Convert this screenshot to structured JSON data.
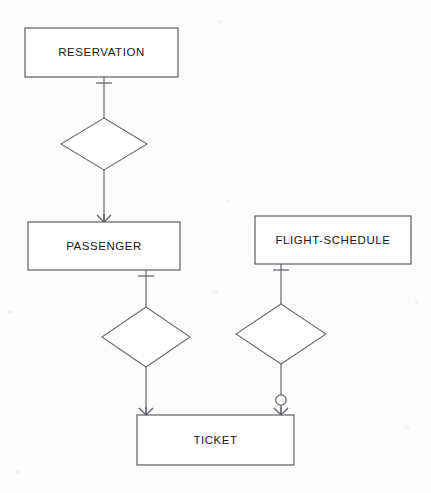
{
  "diagram": {
    "notation": "crow's-foot",
    "canvas": {
      "width": 431,
      "height": 493,
      "background": "#fdfdfd"
    },
    "colors": {
      "stroke": "#58585c",
      "line": "#6e6e74",
      "text": "#18181a",
      "fill": "#ffffff"
    },
    "entities": [
      {
        "id": "reservation",
        "label": "RESERVATION",
        "x": 25,
        "y": 28,
        "width": 153,
        "height": 49
      },
      {
        "id": "passenger",
        "label": "PASSENGER",
        "x": 28,
        "y": 222,
        "width": 152,
        "height": 48
      },
      {
        "id": "flight-schedule",
        "label": "FLIGHT-SCHEDULE",
        "x": 255,
        "y": 216,
        "width": 156,
        "height": 48
      },
      {
        "id": "ticket",
        "label": "TICKET",
        "x": 137,
        "y": 415,
        "width": 157,
        "height": 50
      }
    ],
    "relationships": [
      {
        "id": "reservation-passenger",
        "label": "",
        "cx": 104,
        "cy": 144,
        "rx": 43,
        "ry": 26,
        "from": "reservation",
        "to": "passenger",
        "from_cardinality": "one",
        "to_cardinality": "many"
      },
      {
        "id": "passenger-ticket",
        "label": "",
        "cx": 146,
        "cy": 337,
        "rx": 44,
        "ry": 30,
        "from": "passenger",
        "to": "ticket",
        "from_cardinality": "one",
        "to_cardinality": "many"
      },
      {
        "id": "flight-schedule-ticket",
        "label": "",
        "cx": 281,
        "cy": 334,
        "rx": 45,
        "ry": 30,
        "from": "flight-schedule",
        "to": "ticket",
        "from_cardinality": "one",
        "to_cardinality": "zero-or-many"
      }
    ],
    "connectors": [
      {
        "id": "conn-reservation-diamond",
        "x1": 104,
        "y1": 77,
        "x2": 104,
        "y2": 118
      },
      {
        "id": "conn-diamond-passenger",
        "x1": 104,
        "y1": 170,
        "x2": 104,
        "y2": 222
      },
      {
        "id": "conn-passenger-diamond2",
        "x1": 146,
        "y1": 270,
        "x2": 146,
        "y2": 307
      },
      {
        "id": "conn-diamond2-ticket",
        "x1": 146,
        "y1": 367,
        "x2": 146,
        "y2": 415
      },
      {
        "id": "conn-flight-diamond3",
        "x1": 281,
        "y1": 264,
        "x2": 281,
        "y2": 304
      },
      {
        "id": "conn-diamond3-ticket",
        "x1": 281,
        "y1": 364,
        "x2": 281,
        "y2": 415
      }
    ],
    "cardinality_markers": [
      {
        "id": "one-reservation",
        "type": "one",
        "x": 104,
        "y": 83,
        "orientation": "horizontal"
      },
      {
        "id": "many-passenger",
        "type": "many",
        "x": 104,
        "y": 222,
        "direction": "up"
      },
      {
        "id": "one-passenger",
        "type": "one",
        "x": 146,
        "y": 276,
        "orientation": "horizontal"
      },
      {
        "id": "many-ticket-left",
        "type": "many",
        "x": 146,
        "y": 415,
        "direction": "up"
      },
      {
        "id": "one-flight-schedule",
        "type": "one",
        "x": 281,
        "y": 270,
        "orientation": "horizontal"
      },
      {
        "id": "zero-ticket-right",
        "type": "zero",
        "x": 281,
        "y": 400,
        "radius": 5
      },
      {
        "id": "many-ticket-right",
        "type": "many",
        "x": 281,
        "y": 415,
        "direction": "up"
      }
    ]
  }
}
